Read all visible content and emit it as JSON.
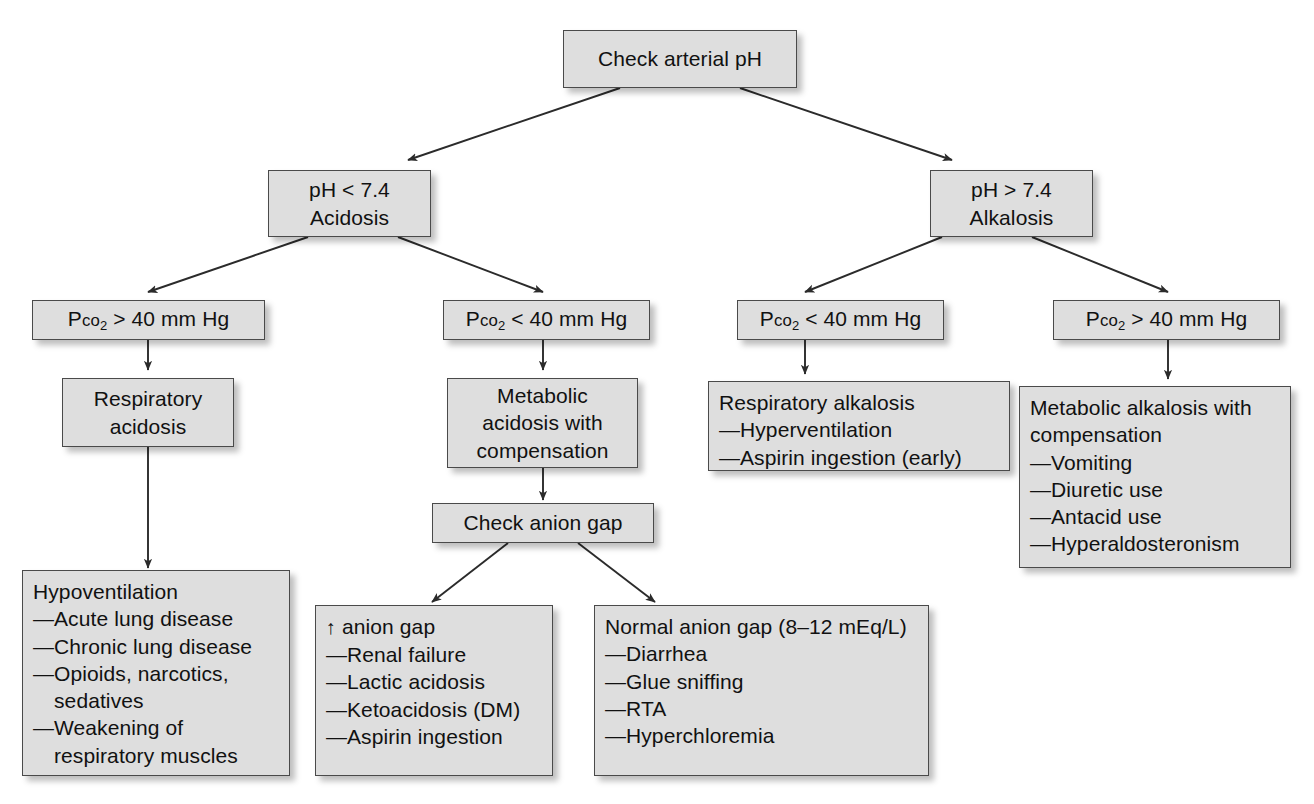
{
  "diagram": {
    "title": "Check arterial pH",
    "type": "flowchart",
    "box_fill": "#dedede",
    "box_border": "#4a4a4a",
    "edge_color": "#333333",
    "nodes": {
      "root": {
        "lines": [
          "Check arterial pH"
        ]
      },
      "acidosis": {
        "lines": [
          "pH < 7.4",
          "Acidosis"
        ]
      },
      "alkalosis": {
        "lines": [
          "pH > 7.4",
          "Alkalosis"
        ]
      },
      "pco2_hi_left": {
        "prefix": "P",
        "sc": "co",
        "sub": "2",
        "rest": " > 40 mm Hg"
      },
      "pco2_lo_mid": {
        "prefix": "P",
        "sc": "co",
        "sub": "2",
        "rest": " < 40 mm Hg"
      },
      "pco2_lo_right": {
        "prefix": "P",
        "sc": "co",
        "sub": "2",
        "rest": " < 40 mm Hg"
      },
      "pco2_hi_right": {
        "prefix": "P",
        "sc": "co",
        "sub": "2",
        "rest": " > 40 mm Hg"
      },
      "resp_acidosis": {
        "lines": [
          "Respiratory",
          "acidosis"
        ]
      },
      "metabolic_acidosis": {
        "lines": [
          "Metabolic",
          "acidosis with",
          "compensation"
        ]
      },
      "check_anion_gap": {
        "lines": [
          "Check anion gap"
        ]
      },
      "resp_alkalosis": {
        "header": "Respiratory alkalosis",
        "dash": "—",
        "items": [
          "Hyperventilation",
          "Aspirin ingestion (early)"
        ]
      },
      "metabolic_alkalosis": {
        "header": "Metabolic alkalosis with compensation",
        "dash": "—",
        "items": [
          "Vomiting",
          "Diuretic use",
          "Antacid use",
          "Hyperaldosteronism"
        ]
      },
      "hypoventilation": {
        "header": "Hypoventilation",
        "dash": "—",
        "items": [
          "Acute lung disease",
          "Chronic lung disease",
          "Opioids, narcotics, sedatives",
          "Weakening of respiratory muscles"
        ]
      },
      "high_anion_gap": {
        "header_arrow": "↑",
        "header": " anion gap",
        "dash": "—",
        "items": [
          "Renal failure",
          "Lactic acidosis",
          "Ketoacidosis (DM)",
          "Aspirin ingestion"
        ]
      },
      "normal_anion_gap": {
        "header": "Normal anion gap (8–12 mEq/L)",
        "dash": "—",
        "items": [
          "Diarrhea",
          "Glue sniffing",
          "RTA",
          "Hyperchloremia"
        ]
      }
    }
  }
}
